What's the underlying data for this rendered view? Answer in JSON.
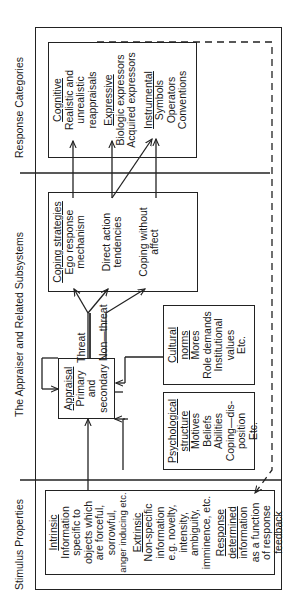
{
  "sections": {
    "stimulus": "Stimulus Properties",
    "appraiser": "The Appraiser and Related Subsystems",
    "response": "Response Categories"
  },
  "stimulus_box": {
    "intrinsic_title": "Intrinsic",
    "intrinsic_lines": [
      "Information",
      "specific to",
      "objects which",
      "are forceful,",
      "sorrowful,",
      "anger inducing etc."
    ],
    "extrinsic_title": "Extrinsic",
    "extrinsic_lines": [
      "Non-specific",
      "information",
      "e.g. novelty,",
      "intensity,",
      "ambiguity,",
      "imminence, etc."
    ],
    "response_title_1": "Response",
    "response_title_2": "determined",
    "response_lines": [
      "information",
      "as a function",
      "of response",
      "feedback"
    ]
  },
  "appraisal_box": {
    "title": "Appraisal",
    "lines": [
      "Primary",
      "and",
      "secondary"
    ]
  },
  "cultural_box": {
    "title_1": "Cultural",
    "title_2": "norms",
    "lines": [
      "Mores",
      "Role demands",
      "Institutional",
      "values",
      "Etc."
    ]
  },
  "psych_box": {
    "title_1": "Psychological",
    "title_2": "structure",
    "lines": [
      "Motives",
      "Beliefs",
      "Abilities",
      "Coping—dis-",
      "position",
      "Etc."
    ]
  },
  "coping_box": {
    "title": "Coping strategies",
    "items": [
      [
        "Ego response",
        "mechanism"
      ],
      [
        "Direct action",
        "tendencies"
      ],
      [
        "Coping without",
        "affect"
      ]
    ]
  },
  "branch_labels": {
    "threat": "Threat",
    "non_threat": "Non—threat"
  },
  "response_box": {
    "cognitive_title": "Cognitive",
    "cognitive_lines": [
      "Realistic and",
      "unrealistic",
      "reappraisals"
    ],
    "expressive_title": "Expressive",
    "expressive_lines": [
      "Biologic expressors",
      "Acquired expressors"
    ],
    "instrumental_title": "Instrumental",
    "instrumental_lines": [
      "Symbols",
      "Operators",
      "Conventions"
    ]
  }
}
